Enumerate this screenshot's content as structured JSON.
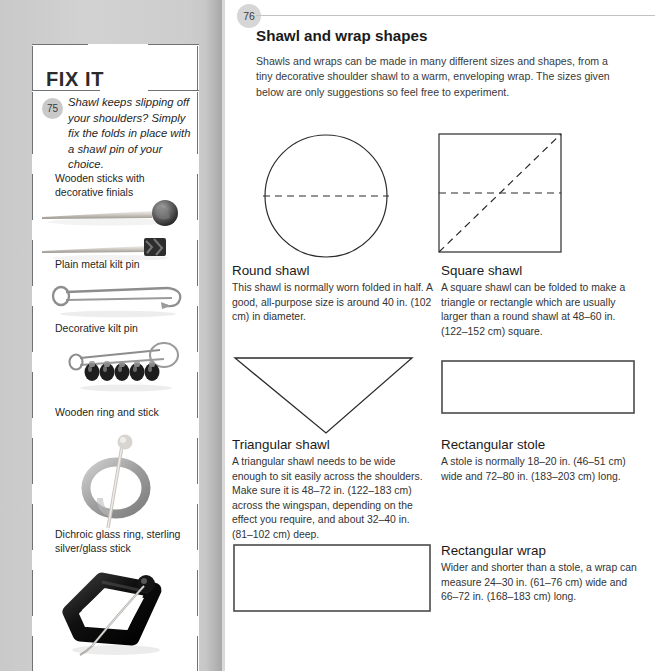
{
  "sidebar": {
    "heading": "FIX IT",
    "tip_number": "75",
    "tip_text": "Shawl keeps slipping off your shoulders? Simply fix the folds in place with a shawl pin of your choice.",
    "items": [
      {
        "label": "Wooden sticks with decorative finials",
        "image": "wooden-sticks-photo"
      },
      {
        "label": "Plain metal kilt pin",
        "image": "plain-kilt-pin-photo"
      },
      {
        "label": "Decorative kilt pin",
        "image": "decorative-kilt-pin-photo"
      },
      {
        "label": "Wooden ring and stick",
        "image": "wooden-ring-stick-photo"
      },
      {
        "label": "Dichroic glass ring, sterling silver/glass stick",
        "image": "dichroic-glass-ring-photo"
      }
    ]
  },
  "main": {
    "page_number": "76",
    "title": "Shawl and wrap shapes",
    "intro": "Shawls and wraps can be made in many different sizes and shapes, from a tiny decorative shoulder shawl to a warm, enveloping wrap. The sizes given below are only suggestions so feel free to experiment.",
    "shapes": [
      {
        "id": "round-shawl",
        "title": "Round shawl",
        "body": "This shawl is normally worn folded in half. A good, all-purpose size is around 40 in. (102 cm) in diameter.",
        "diagram": "circle-with-horizontal-fold-line"
      },
      {
        "id": "square-shawl",
        "title": "Square shawl",
        "body": "A square shawl can be folded to make a triangle or rectangle which are usually larger than a round shawl at 48–60 in. (122–152 cm) square.",
        "diagram": "square-with-horizontal-and-diagonal-fold-lines"
      },
      {
        "id": "triangular-shawl",
        "title": "Triangular shawl",
        "body": "A triangular shawl needs to be wide enough to sit easily across the shoulders. Make sure it is 48–72 in. (122–183 cm) across the wingspan, depending on the effect you require, and about 32–40 in. (81–102 cm) deep.",
        "diagram": "downward-triangle"
      },
      {
        "id": "rectangular-stole",
        "title": "Rectangular stole",
        "body": "A stole is normally 18–20 in. (46–51 cm) wide and 72–80 in. (183–203 cm) long.",
        "diagram": "wide-thin-rectangle"
      },
      {
        "id": "rectangular-wrap",
        "title": "Rectangular wrap",
        "body": "Wider and shorter than a stole, a wrap can measure 24–30 in. (61–76 cm) wide and 66–72 in. (168–183 cm) long.",
        "diagram": "wide-tall-rectangle"
      }
    ]
  },
  "colors": {
    "page_bleed_gray": "#cfcfcf",
    "badge_gray": "#d6d6d6",
    "rule_gray": "#c3c3c3",
    "ink": "#1a1a1a",
    "diagram_stroke": "#2b2b2b"
  }
}
